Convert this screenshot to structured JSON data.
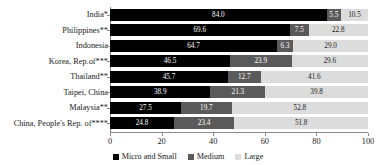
{
  "chart_data": {
    "type": "bar",
    "orientation": "horizontal",
    "stacked": true,
    "title": "",
    "xlabel": "",
    "ylabel": "",
    "xlim": [
      0,
      100
    ],
    "xticks": [
      0,
      20,
      40,
      60,
      80,
      100
    ],
    "grid": false,
    "legend_position": "bottom",
    "categories": [
      "India*",
      "Philippines**",
      "Indonesia",
      "Korea, Rep.of***",
      "Thailand**",
      "Taipei, China",
      "Malaysia**",
      "China, People's Rep. of****"
    ],
    "series": [
      {
        "name": "Micro and Small",
        "color": "#000000",
        "values": [
          84.0,
          69.6,
          64.7,
          46.5,
          45.7,
          38.9,
          27.5,
          24.8
        ]
      },
      {
        "name": "Medium",
        "color": "#5a5a5a",
        "values": [
          5.5,
          7.5,
          6.3,
          23.9,
          12.7,
          21.3,
          19.7,
          23.4
        ]
      },
      {
        "name": "Large",
        "color": "#dcdcdc",
        "values": [
          10.5,
          22.8,
          29.0,
          29.6,
          41.6,
          39.8,
          52.8,
          51.8
        ]
      }
    ]
  },
  "legend": {
    "items": [
      {
        "label": "Micro and Small",
        "color": "#000000"
      },
      {
        "label": "Medium",
        "color": "#5a5a5a"
      },
      {
        "label": "Large",
        "color": "#dcdcdc"
      }
    ]
  }
}
